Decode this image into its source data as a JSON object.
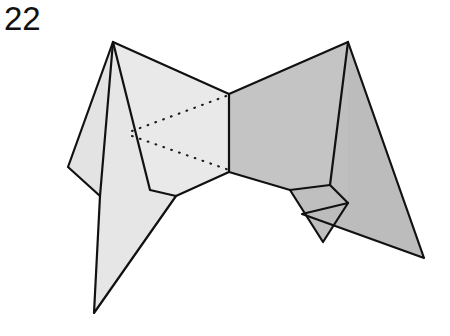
{
  "figure": {
    "label": "22",
    "caption_text": "22",
    "kind": "line-drawing",
    "background_color": "#ffffff",
    "stroke_color": "#111111",
    "stroke_width": 2.2,
    "dotted_stroke_color": "#1a1a1a",
    "fills": {
      "light_gray": "#e3e3e3",
      "light_gray_2": "#e7e7e7",
      "mid_gray": "#c9c9c9",
      "dark_gray": "#b9b9b9",
      "darker_gray": "#b0b0b0"
    },
    "panels": [
      {
        "name": "left-outer-wing",
        "fill": "#e3e3e3",
        "points": "113,42 68,167 100,196 150,190"
      },
      {
        "name": "left-lower-blade",
        "fill": "#e6e6e6",
        "points": "113,42 150,190 176,196 94,313 100,196"
      },
      {
        "name": "left-inner-face",
        "fill": "#e9e9e9",
        "points": "113,42 229,94 229,172 176,196 150,190"
      },
      {
        "name": "right-inner-face",
        "fill": "#c4c4c4",
        "points": "229,94 348,42 330,185 290,190 229,172"
      },
      {
        "name": "right-middle-blade",
        "fill": "#bfbfbf",
        "points": "348,42 348,203 323,242 290,190 330,185"
      },
      {
        "name": "right-outer-wing",
        "fill": "#bcbcbc",
        "points": "348,42 424,258 302,214 348,203"
      }
    ],
    "solid_lines": [
      {
        "name": "left-apex-to-left-notch",
        "from": "113,42",
        "to": "68,167"
      },
      {
        "name": "left-notch-to-left-mid",
        "from": "68,167",
        "to": "100,196"
      },
      {
        "name": "left-apex-vertical-fold",
        "from": "113,42",
        "to": "100,196"
      },
      {
        "name": "left-mid-to-bottom-tip",
        "from": "100,196",
        "to": "94,313"
      },
      {
        "name": "bottom-tip-to-left-valley",
        "from": "94,313",
        "to": "176,196"
      },
      {
        "name": "left-apex-to-left-valley",
        "from": "113,42",
        "to": "150,190"
      },
      {
        "name": "left-valley-short",
        "from": "150,190",
        "to": "176,196"
      },
      {
        "name": "left-apex-to-top-center",
        "from": "113,42",
        "to": "229,94"
      },
      {
        "name": "center-vertical-fold",
        "from": "229,94",
        "to": "229,172"
      },
      {
        "name": "left-valley-to-bottom-center",
        "from": "176,196",
        "to": "229,172"
      },
      {
        "name": "top-center-to-right-apex",
        "from": "229,94",
        "to": "348,42"
      },
      {
        "name": "bottom-center-to-right-valley",
        "from": "229,172",
        "to": "290,190"
      },
      {
        "name": "right-valley-to-right-fold",
        "from": "290,190",
        "to": "330,185"
      },
      {
        "name": "right-apex-to-right-fold",
        "from": "348,42",
        "to": "330,185"
      },
      {
        "name": "right-fold-to-right-notch",
        "from": "330,185",
        "to": "348,203"
      },
      {
        "name": "right-valley-to-lower-notch",
        "from": "290,190",
        "to": "323,242"
      },
      {
        "name": "right-notch-to-lower-notch",
        "from": "348,203",
        "to": "323,242"
      },
      {
        "name": "right-apex-to-far-tip",
        "from": "348,42",
        "to": "424,258"
      },
      {
        "name": "far-tip-to-inner",
        "from": "424,258",
        "to": "302,214"
      },
      {
        "name": "inner-to-right-notch",
        "from": "302,214",
        "to": "348,203"
      }
    ],
    "dotted_lines": [
      {
        "name": "upper-dotted-fold",
        "from": "132,131",
        "to": "229,95"
      },
      {
        "name": "lower-dotted-fold",
        "from": "132,136",
        "to": "229,170"
      }
    ]
  }
}
